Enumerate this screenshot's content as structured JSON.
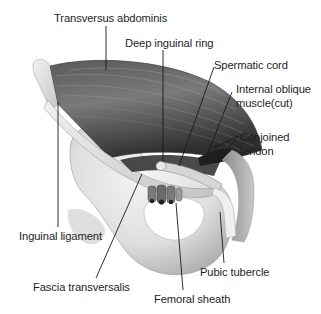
{
  "figure": {
    "labels": [
      {
        "id": "transversus-abdominis",
        "text": "Transversus abdominis",
        "x": 54,
        "y": 12
      },
      {
        "id": "deep-inguinal-ring",
        "text": "Deep inguinal ring",
        "x": 125,
        "y": 37
      },
      {
        "id": "spermatic-cord",
        "text": "Spermatic cord",
        "x": 214,
        "y": 59
      },
      {
        "id": "internal-oblique-line1",
        "text": "Internal oblique",
        "x": 236,
        "y": 83
      },
      {
        "id": "internal-oblique-line2",
        "text": "muscle(cut)",
        "x": 236,
        "y": 97
      },
      {
        "id": "conjoined-tendon-line1",
        "text": "Conjoined",
        "x": 240,
        "y": 131
      },
      {
        "id": "conjoined-tendon-line2",
        "text": "tendon",
        "x": 240,
        "y": 145
      },
      {
        "id": "inguinal-ligament",
        "text": "Inguinal ligament",
        "x": 19,
        "y": 230
      },
      {
        "id": "pubic-tubercle",
        "text": "Pubic tubercle",
        "x": 200,
        "y": 266
      },
      {
        "id": "fascia-transversalis",
        "text": "Fascia transversalis",
        "x": 33,
        "y": 281
      },
      {
        "id": "femoral-sheath",
        "text": "Femoral sheath",
        "x": 154,
        "y": 293
      }
    ],
    "colors": {
      "text": "#1e1e1e",
      "leader": "#1a1a1a",
      "muscle_dark": "#3a3a3a",
      "muscle_mid": "#6e6e6e",
      "muscle_light": "#9a9a9a",
      "bone_light": "#ececec",
      "bone_shade": "#b8b8b8",
      "background": "#ffffff"
    }
  }
}
